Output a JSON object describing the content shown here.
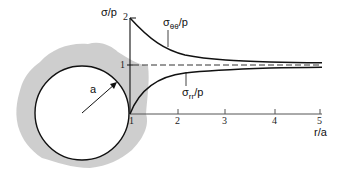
{
  "diagram": {
    "y_axis_label": "σ/p",
    "x_axis_label": "r/a",
    "radius_label": "a",
    "y_ticks": [
      "1",
      "2"
    ],
    "x_ticks": [
      "1",
      "2",
      "3",
      "4",
      "5"
    ],
    "curves": [
      {
        "name": "hoop-stress",
        "label_main": "σ",
        "label_sub": "θθ",
        "label_tail": "/p",
        "formula": "1 + 1/(r/a)^2",
        "start": 2,
        "asymptote": 1
      },
      {
        "name": "radial-stress",
        "label_main": "σ",
        "label_sub": "rr",
        "label_tail": "/p",
        "formula": "1 - 1/(r/a)^2",
        "start": 0,
        "asymptote": 1
      }
    ],
    "reference_line": {
      "value": 1,
      "style": "dashed"
    },
    "colors": {
      "material": "#c9c9c9",
      "line": "#111111",
      "hole": "#ffffff"
    }
  }
}
